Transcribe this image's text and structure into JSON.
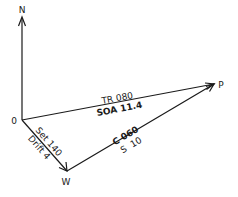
{
  "diagram": {
    "type": "current-sailing vector triangle",
    "points": {
      "north": {
        "label": "N"
      },
      "origin": {
        "label": "0"
      },
      "destination": {
        "label": "P"
      },
      "current_end": {
        "label": "W"
      }
    },
    "vectors": {
      "track": {
        "from": "0",
        "to": "P",
        "label_above": "TR 080",
        "label_below": "SOA 11.4"
      },
      "current": {
        "from": "0",
        "to": "W",
        "label_above": "Set 140",
        "label_below": "Drift 4"
      },
      "course": {
        "from": "W",
        "to": "P",
        "label_above": "C 060",
        "label_below": "S  10"
      },
      "north_reference": {
        "from": "0",
        "to": "N"
      }
    }
  }
}
